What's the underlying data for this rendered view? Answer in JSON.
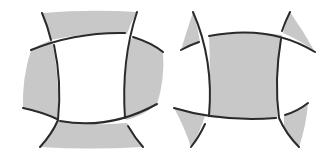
{
  "figure": {
    "colors": {
      "background": "#ffffff",
      "shade": "#c8c8c8",
      "line": "#2a2a2a"
    },
    "panels": [
      {
        "id": "left",
        "shaded": [
          "top-band",
          "left-lobe",
          "right-lobe",
          "bottom-band"
        ],
        "center": "white"
      },
      {
        "id": "right",
        "shaded": [
          "center-square",
          "top-left-corner",
          "top-right-corner",
          "bottom-left-corner",
          "bottom-right-corner"
        ],
        "center": "shaded"
      }
    ]
  }
}
